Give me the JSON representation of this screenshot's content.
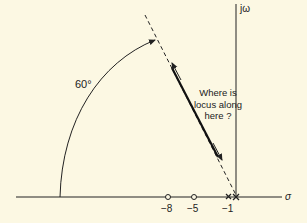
{
  "axes": {
    "real_label": "σ",
    "imag_label": "jω"
  },
  "angle_label": "60°",
  "annotation": [
    "Where is",
    "locus along",
    "here ?"
  ],
  "ticks": [
    {
      "label": "−8",
      "kind": "zero"
    },
    {
      "label": "−5",
      "kind": "zero"
    },
    {
      "label": "−1",
      "kind": "pole"
    }
  ],
  "origin_marker": "double-pole",
  "colors": {
    "background": "#fcf8e3",
    "ink": "#222222"
  }
}
